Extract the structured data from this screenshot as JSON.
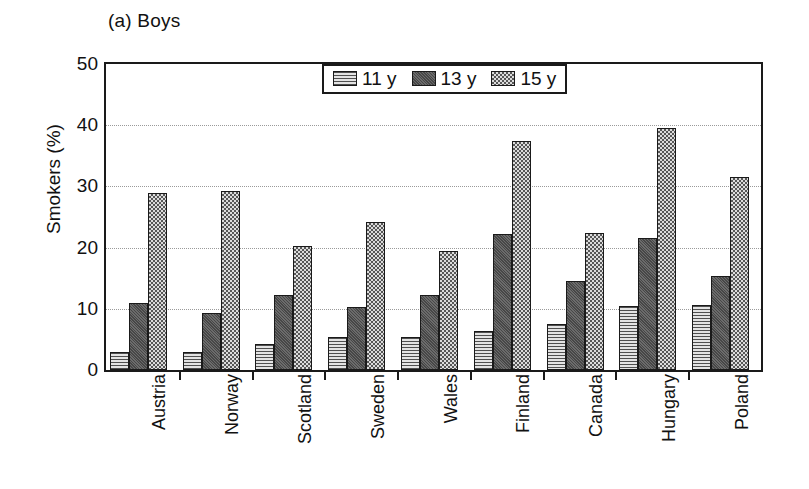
{
  "chart_data": {
    "type": "bar",
    "title": "(a) Boys",
    "xlabel": "",
    "ylabel": "Smokers (%)",
    "ylim": [
      0,
      50
    ],
    "yticks": [
      0,
      10,
      20,
      30,
      40,
      50
    ],
    "grid": true,
    "legend_position": "top-center",
    "categories": [
      "Austria",
      "Norway",
      "Scotland",
      "Sweden",
      "Wales",
      "Finland",
      "Canada",
      "Hungary",
      "Poland"
    ],
    "series": [
      {
        "name": "11 y",
        "values": [
          3.0,
          3.0,
          4.2,
          5.4,
          5.4,
          6.3,
          7.5,
          10.5,
          10.6
        ]
      },
      {
        "name": "13 y",
        "values": [
          11.0,
          9.3,
          12.2,
          10.3,
          12.2,
          22.3,
          14.5,
          21.5,
          15.4
        ]
      },
      {
        "name": "15 y",
        "values": [
          29.0,
          29.3,
          20.2,
          24.2,
          19.4,
          37.5,
          22.4,
          39.6,
          31.6
        ]
      }
    ],
    "series_colors": [
      "#d6d6d6",
      "#5b5b5b",
      "#c9c9c9"
    ]
  },
  "legend": {
    "items": [
      {
        "label": "11 y",
        "pattern": "horizontal-lines-light"
      },
      {
        "label": "13 y",
        "pattern": "solid-dark-gray"
      },
      {
        "label": "15 y",
        "pattern": "checkerboard"
      }
    ]
  }
}
